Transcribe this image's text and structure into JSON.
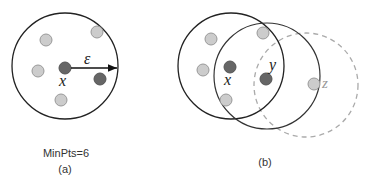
{
  "panel_a": {
    "caption_param": "MinPts=6",
    "caption_label": "(a)",
    "point_label": "x",
    "radius_label": "ε"
  },
  "panel_b": {
    "caption_label": "(b)",
    "point_labels": {
      "x": "x",
      "y": "y",
      "z": "z"
    }
  },
  "colors": {
    "core_point": "#666666",
    "border_point": "#cccccc",
    "point_stroke": "#999999",
    "solid_circle": "#222222",
    "dashed_circle": "#aaaaaa"
  }
}
